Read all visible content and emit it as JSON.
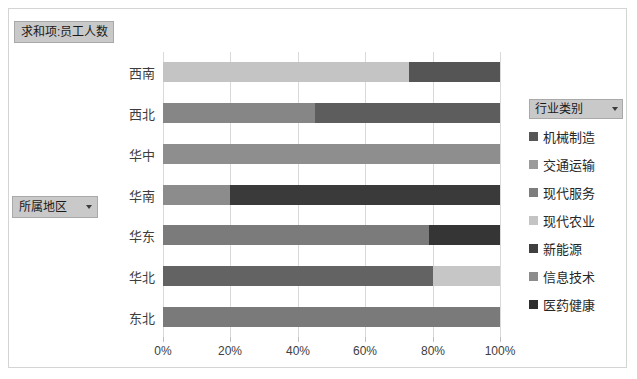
{
  "window": {
    "background_color": "#ffffff",
    "frame_border_color": "#d4d4d4"
  },
  "value_field": {
    "label": "求和项:员工人数"
  },
  "row_field": {
    "label": "所属地区",
    "dropdown_icon": "chevron-down-icon"
  },
  "legend_field": {
    "label": "行业类别",
    "dropdown_icon": "chevron-down-icon"
  },
  "chart_data": {
    "type": "bar",
    "subtype": "100% stacked horizontal bar",
    "title": "求和项:员工人数",
    "xlabel": "",
    "ylabel": "所属地区",
    "xlim": [
      0,
      100
    ],
    "xticks": [
      0,
      20,
      40,
      60,
      80,
      100
    ],
    "xtick_labels": [
      "0%",
      "20%",
      "40%",
      "60%",
      "80%",
      "100%"
    ],
    "grid": true,
    "legend_position": "right",
    "legend_title": "行业类别",
    "categories": [
      "西南",
      "西北",
      "华中",
      "华南",
      "华东",
      "华北",
      "东北"
    ],
    "series": [
      {
        "name": "机械制造",
        "color": "#565656",
        "values": [
          0,
          0,
          0,
          0,
          79,
          80,
          0
        ]
      },
      {
        "name": "交通运输",
        "color": "#9a9a9a",
        "values": [
          0,
          0,
          100,
          0,
          0,
          0,
          0
        ]
      },
      {
        "name": "现代服务",
        "color": "#7d7d7d",
        "values": [
          0,
          45,
          0,
          0,
          0,
          0,
          100
        ]
      },
      {
        "name": "现代农业",
        "color": "#c4c4c4",
        "values": [
          73,
          0,
          0,
          0,
          0,
          20,
          0
        ]
      },
      {
        "name": "新能源",
        "color": "#3f3f3f",
        "values": [
          0,
          55,
          0,
          0,
          21,
          0,
          0
        ]
      },
      {
        "name": "信息技术",
        "color": "#8c8c8c",
        "values": [
          0,
          0,
          0,
          20,
          0,
          0,
          0
        ]
      },
      {
        "name": "医药健康",
        "color": "#2e2e2e",
        "values": [
          27,
          0,
          0,
          80,
          0,
          0,
          0
        ]
      }
    ],
    "bars": [
      {
        "category": "西南",
        "segments": [
          {
            "series": "现代农业",
            "value": 73,
            "color": "#c4c4c4"
          },
          {
            "series": "医药健康",
            "value": 27,
            "color": "#555555"
          }
        ]
      },
      {
        "category": "西北",
        "segments": [
          {
            "series": "现代服务",
            "value": 45,
            "color": "#868686"
          },
          {
            "series": "新能源",
            "value": 55,
            "color": "#5d5d5d"
          }
        ]
      },
      {
        "category": "华中",
        "segments": [
          {
            "series": "交通运输",
            "value": 100,
            "color": "#8e8e8e"
          }
        ]
      },
      {
        "category": "华南",
        "segments": [
          {
            "series": "信息技术",
            "value": 20,
            "color": "#8c8c8c"
          },
          {
            "series": "医药健康",
            "value": 80,
            "color": "#3a3a3a"
          }
        ]
      },
      {
        "category": "华东",
        "segments": [
          {
            "series": "机械制造",
            "value": 79,
            "color": "#7b7b7b"
          },
          {
            "series": "新能源",
            "value": 21,
            "color": "#353535"
          }
        ]
      },
      {
        "category": "华北",
        "segments": [
          {
            "series": "机械制造",
            "value": 80,
            "color": "#636363"
          },
          {
            "series": "现代农业",
            "value": 20,
            "color": "#c6c6c6"
          }
        ]
      },
      {
        "category": "东北",
        "segments": [
          {
            "series": "现代服务",
            "value": 100,
            "color": "#7a7a7a"
          }
        ]
      }
    ]
  }
}
